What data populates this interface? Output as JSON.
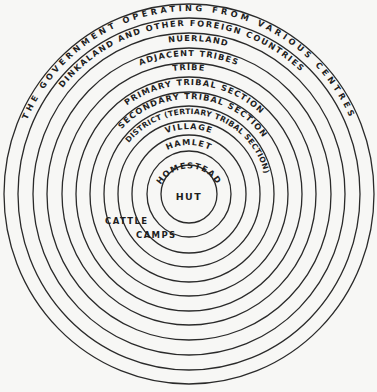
{
  "diagram": {
    "center_label": "HUT",
    "rings": [
      {
        "label": "HOMESTEAD"
      },
      {
        "label": "HAMLET"
      },
      {
        "label": "VILLAGE"
      },
      {
        "label": "DISTRICT (TERTIARY TRIBAL SECTION)"
      },
      {
        "label": "SECONDARY TRIBAL SECTION"
      },
      {
        "label": "PRIMARY TRIBAL SECTION"
      },
      {
        "label": "TRIBE"
      },
      {
        "label": "ADJACENT TRIBES"
      },
      {
        "label": "NUERLAND"
      },
      {
        "label": "DINKALAND AND OTHER FOREIGN COUNTRIES"
      },
      {
        "label": "THE GOVERNMENT OPERATING FROM VARIOUS CENTRES"
      }
    ],
    "side_label_line1": "CATTLE",
    "side_label_line2": "CAMPS",
    "line_color": "#2a2a2a",
    "background": "#f7f7f5"
  }
}
